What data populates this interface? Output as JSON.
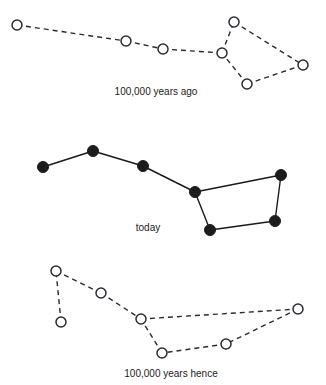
{
  "figure": {
    "background_color": "#ffffff",
    "ink_color": "#1a1a1a",
    "width": 326,
    "height": 385
  },
  "chart_data": {
    "type": "scatter",
    "subtitle": "",
    "xlabel": "",
    "ylabel": "",
    "grid": false,
    "legend": "none",
    "xlim": [
      0,
      326
    ],
    "ylim": [
      0,
      385
    ],
    "note": "Three star-chart panels showing the same seven stars of the Big Dipper at three epochs. Coordinates are in image pixel space (y increases downward). Marker style 'open' = hollow circle, 'filled' = solid black dot. Edge style 'dashed' or 'solid'.",
    "panels": [
      {
        "id": "past",
        "label": "100,000 years ago",
        "label_x": 156,
        "label_y": 95,
        "marker": "open",
        "edge_style": "dashed",
        "marker_radius": 5,
        "points": [
          {
            "name": "star-1",
            "x": 17,
            "y": 25
          },
          {
            "name": "star-2",
            "x": 126,
            "y": 41
          },
          {
            "name": "star-3",
            "x": 163,
            "y": 49
          },
          {
            "name": "star-4",
            "x": 222,
            "y": 53
          },
          {
            "name": "star-5",
            "x": 234,
            "y": 22
          },
          {
            "name": "star-6",
            "x": 303,
            "y": 65
          },
          {
            "name": "star-7",
            "x": 247,
            "y": 84
          }
        ],
        "edges": [
          [
            "star-1",
            "star-2"
          ],
          [
            "star-2",
            "star-3"
          ],
          [
            "star-3",
            "star-4"
          ],
          [
            "star-4",
            "star-5"
          ],
          [
            "star-5",
            "star-6"
          ],
          [
            "star-6",
            "star-7"
          ],
          [
            "star-7",
            "star-4"
          ]
        ]
      },
      {
        "id": "today",
        "label": "today",
        "label_x": 148,
        "label_y": 231,
        "marker": "filled",
        "edge_style": "solid",
        "marker_radius": 5.5,
        "points": [
          {
            "name": "star-1",
            "x": 43,
            "y": 167
          },
          {
            "name": "star-2",
            "x": 93,
            "y": 151
          },
          {
            "name": "star-3",
            "x": 143,
            "y": 166
          },
          {
            "name": "star-4",
            "x": 195,
            "y": 192
          },
          {
            "name": "star-5",
            "x": 281,
            "y": 175
          },
          {
            "name": "star-6",
            "x": 275,
            "y": 221
          },
          {
            "name": "star-7",
            "x": 210,
            "y": 230
          }
        ],
        "edges": [
          [
            "star-1",
            "star-2"
          ],
          [
            "star-2",
            "star-3"
          ],
          [
            "star-3",
            "star-4"
          ],
          [
            "star-4",
            "star-5"
          ],
          [
            "star-5",
            "star-6"
          ],
          [
            "star-6",
            "star-7"
          ],
          [
            "star-7",
            "star-4"
          ]
        ]
      },
      {
        "id": "future",
        "label": "100,000 years hence",
        "label_x": 171,
        "label_y": 377,
        "marker": "open",
        "edge_style": "dashed",
        "marker_radius": 5,
        "points": [
          {
            "name": "star-1",
            "x": 61,
            "y": 322
          },
          {
            "name": "star-2",
            "x": 56,
            "y": 271
          },
          {
            "name": "star-3",
            "x": 101,
            "y": 293
          },
          {
            "name": "star-4",
            "x": 141,
            "y": 319
          },
          {
            "name": "star-5",
            "x": 298,
            "y": 309
          },
          {
            "name": "star-6",
            "x": 226,
            "y": 344
          },
          {
            "name": "star-7",
            "x": 162,
            "y": 353
          }
        ],
        "edges": [
          [
            "star-1",
            "star-2"
          ],
          [
            "star-2",
            "star-3"
          ],
          [
            "star-3",
            "star-4"
          ],
          [
            "star-4",
            "star-5"
          ],
          [
            "star-5",
            "star-6"
          ],
          [
            "star-6",
            "star-7"
          ],
          [
            "star-7",
            "star-4"
          ]
        ]
      }
    ]
  }
}
